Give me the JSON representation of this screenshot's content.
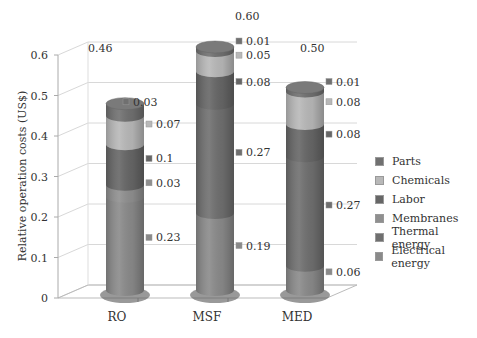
{
  "chart_data": {
    "type": "bar",
    "subtype": "3d-stacked-cylinder",
    "title": "",
    "xlabel": "",
    "ylabel": "Relative operation costs (US$)",
    "ylim": [
      0,
      0.6
    ],
    "yticks": [
      "0",
      "0.1",
      "0.2",
      "0.3",
      "0.4",
      "0.5",
      "0.6"
    ],
    "grid": true,
    "legend_position": "right",
    "categories": [
      "RO",
      "MSF",
      "MED"
    ],
    "totals": [
      "0.46",
      "0.60",
      "0.50"
    ],
    "series": [
      {
        "name": "Electrical energy",
        "values": [
          0.23,
          0.19,
          0.06
        ],
        "labels": [
          "0.23",
          "0.19",
          "0.06"
        ],
        "color": "#8a8a8a"
      },
      {
        "name": "Thermal energy",
        "values": [
          0,
          0.27,
          0.27
        ],
        "labels": [
          "",
          "0.27",
          "0.27"
        ],
        "color": "#6f6f6f"
      },
      {
        "name": "Membranes",
        "values": [
          0.03,
          0,
          0
        ],
        "labels": [
          "0.03",
          "",
          ""
        ],
        "color": "#8f8f8f"
      },
      {
        "name": "Labor",
        "values": [
          0.1,
          0.08,
          0.08
        ],
        "labels": [
          "0.1",
          "0.08",
          "0.08"
        ],
        "color": "#666666"
      },
      {
        "name": "Chemicals",
        "values": [
          0.07,
          0.05,
          0.08
        ],
        "labels": [
          "0.07",
          "0.05",
          "0.08"
        ],
        "color": "#b8b8b8"
      },
      {
        "name": "Parts",
        "values": [
          0.03,
          0.01,
          0.01
        ],
        "labels": [
          "0.03",
          "0.01",
          "0.01"
        ],
        "color": "#707070"
      }
    ]
  },
  "legend": {
    "items": [
      {
        "label": "Parts",
        "color": "#707070"
      },
      {
        "label": "Chemicals",
        "color": "#b8b8b8"
      },
      {
        "label": "Labor",
        "color": "#666666"
      },
      {
        "label": "Membranes",
        "color": "#8f8f8f"
      },
      {
        "label": "Thermal energy",
        "color": "#6f6f6f"
      },
      {
        "label": "Electrical energy",
        "color": "#8a8a8a"
      }
    ]
  }
}
